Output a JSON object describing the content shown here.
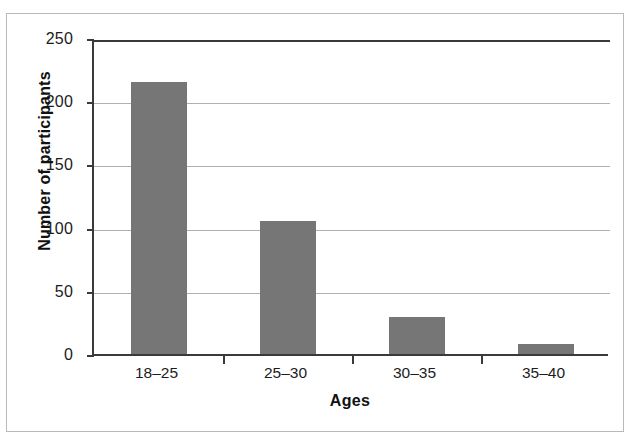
{
  "chart_data": {
    "type": "bar",
    "title": "",
    "subtitle": "",
    "xlabel": "Ages",
    "ylabel": "Number of participants",
    "categories": [
      "18–25",
      "25–30",
      "30–35",
      "35–40"
    ],
    "values": [
      215,
      105,
      29,
      8
    ],
    "series": [
      {
        "name": "Number of participants",
        "values": [
          215,
          105,
          29,
          8
        ]
      }
    ],
    "ylim": [
      0,
      250
    ],
    "yticks": [
      0,
      50,
      100,
      150,
      200,
      250
    ],
    "ytick_labels": [
      "0",
      "50",
      "100",
      "150",
      "200",
      "250"
    ],
    "grid": "horizontal",
    "legend": "none",
    "bar_color": "#767676",
    "axis_color": "#3a3a3a",
    "gridline_color": "#b0b0b0",
    "frame_color": "#b9b9b9",
    "background": "#ffffff",
    "annotations": []
  }
}
